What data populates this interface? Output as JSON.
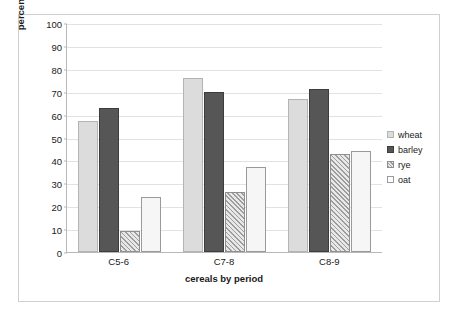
{
  "chart_data": {
    "type": "bar",
    "title": "",
    "xlabel": "cereals by period",
    "ylabel": "percentage samples where present",
    "categories": [
      "C5-6",
      "C7-8",
      "C8-9"
    ],
    "series": [
      {
        "name": "wheat",
        "values": [
          57,
          76,
          67
        ]
      },
      {
        "name": "barley",
        "values": [
          63,
          70,
          71
        ]
      },
      {
        "name": "rye",
        "values": [
          9,
          26,
          43
        ]
      },
      {
        "name": "oat",
        "values": [
          24,
          37,
          44
        ]
      }
    ],
    "ylim": [
      0,
      100
    ],
    "yticks": [
      0,
      10,
      20,
      30,
      40,
      50,
      60,
      70,
      80,
      90,
      100
    ],
    "ytick_labels": [
      "0",
      "10",
      "20",
      "30",
      "40",
      "50",
      "60",
      "70",
      "80",
      "90",
      "100"
    ],
    "grid": true,
    "legend_position": "right",
    "legend_entries": [
      "wheat",
      "barley",
      "rye",
      "oat"
    ],
    "colors": {
      "wheat": "#dcdcdc",
      "barley": "#565656",
      "rye": "#c9c9c9",
      "oat": "#f6f6f6",
      "gridline": "#e2e2e2",
      "axis": "#b8b8b8",
      "text": "#1a1a1a",
      "frame": "#d0d0d0"
    }
  }
}
